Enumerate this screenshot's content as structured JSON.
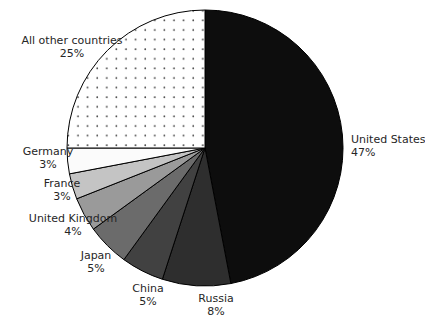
{
  "chart_data": {
    "type": "pie",
    "title": "",
    "subtitle": "",
    "xlabel": "",
    "ylabel": "",
    "legend_position": "none",
    "grid": false,
    "start_angle_deg": 0,
    "direction": "clockwise",
    "units": "percent",
    "total": 100,
    "categories": [
      "United States",
      "Russia",
      "China",
      "Japan",
      "United Kingdom",
      "France",
      "Germany",
      "All other countries"
    ],
    "values": [
      47,
      8,
      5,
      5,
      4,
      3,
      3,
      25
    ],
    "value_labels": [
      "47%",
      "8%",
      "5%",
      "5%",
      "4%",
      "3%",
      "3%",
      "25%"
    ],
    "slices": [
      {
        "name": "United States",
        "value": 47,
        "value_label": "47%",
        "color": "#0d0d0d",
        "pattern": "solid",
        "label_x": 351,
        "label_y": 143,
        "label_anchor": "start"
      },
      {
        "name": "Russia",
        "value": 8,
        "value_label": "8%",
        "color": "#2e2e2e",
        "pattern": "solid",
        "label_x": 216,
        "label_y": 302,
        "label_anchor": "middle"
      },
      {
        "name": "China",
        "value": 5,
        "value_label": "5%",
        "color": "#414141",
        "pattern": "solid",
        "label_x": 148,
        "label_y": 292,
        "label_anchor": "middle"
      },
      {
        "name": "Japan",
        "value": 5,
        "value_label": "5%",
        "color": "#6b6b6b",
        "pattern": "solid",
        "label_x": 96,
        "label_y": 259,
        "label_anchor": "middle"
      },
      {
        "name": "United Kingdom",
        "value": 4,
        "value_label": "4%",
        "color": "#9a9a9a",
        "pattern": "solid",
        "label_x": 73,
        "label_y": 222,
        "label_anchor": "middle"
      },
      {
        "name": "France",
        "value": 3,
        "value_label": "3%",
        "color": "#c4c4c4",
        "pattern": "solid",
        "label_x": 62,
        "label_y": 187,
        "label_anchor": "middle"
      },
      {
        "name": "Germany",
        "value": 3,
        "value_label": "3%",
        "color": "#fbfbfb",
        "pattern": "solid",
        "label_x": 48,
        "label_y": 155,
        "label_anchor": "middle"
      },
      {
        "name": "All other countries",
        "value": 25,
        "value_label": "25%",
        "color": "#ffffff",
        "pattern": "dots",
        "label_x": 72,
        "label_y": 44,
        "label_anchor": "middle"
      }
    ],
    "geometry": {
      "center_x": 205,
      "center_y": 148,
      "radius": 138
    }
  }
}
